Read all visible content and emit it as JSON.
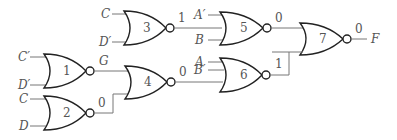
{
  "diagram": {
    "type": "logic-circuit",
    "gate_type": "NOR",
    "gates": [
      {
        "id": "1",
        "label": "1",
        "inputs": [
          "C′",
          "D′"
        ],
        "output_label": "G"
      },
      {
        "id": "2",
        "label": "2",
        "inputs": [
          "C",
          "D"
        ],
        "output_label": "0"
      },
      {
        "id": "3",
        "label": "3",
        "inputs": [
          "C",
          "D′"
        ],
        "output_label": "1"
      },
      {
        "id": "4",
        "label": "4",
        "inputs": [
          "G",
          "0"
        ],
        "output_label": "0"
      },
      {
        "id": "5",
        "label": "5",
        "inputs": [
          "A′",
          "B"
        ],
        "output_label": "0"
      },
      {
        "id": "6",
        "label": "6",
        "inputs": [
          "A",
          "B′",
          "0"
        ],
        "output_label": "1"
      },
      {
        "id": "7",
        "label": "7",
        "inputs": [
          "0",
          "1"
        ],
        "output_label": "0"
      }
    ],
    "output": {
      "name": "F",
      "value": "0"
    },
    "colors": {
      "gate_stroke": "#222222",
      "wire": "#777777",
      "text": "#555555",
      "background": "#ffffff"
    }
  }
}
